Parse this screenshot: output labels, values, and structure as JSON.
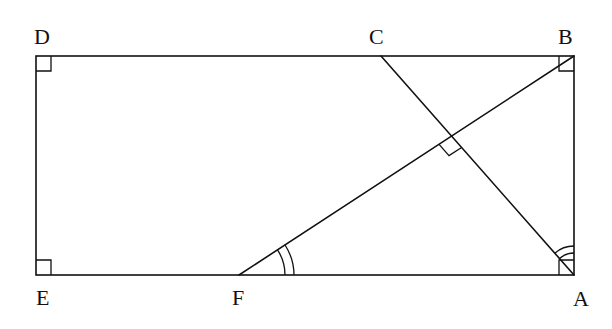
{
  "diagram": {
    "title": "",
    "points": {
      "D": {
        "label": "D",
        "x": 36,
        "y": 56
      },
      "C": {
        "label": "C",
        "x": 381,
        "y": 56
      },
      "B": {
        "label": "B",
        "x": 574,
        "y": 56
      },
      "E": {
        "label": "E",
        "x": 36,
        "y": 275
      },
      "F": {
        "label": "F",
        "x": 239,
        "y": 275
      },
      "A": {
        "label": "A",
        "x": 574,
        "y": 275
      }
    },
    "segments": [
      "DB",
      "BA",
      "AE",
      "ED",
      "CA",
      "FB"
    ],
    "right_angles": [
      "D",
      "B",
      "E",
      "A",
      "intersection of CA and FB"
    ],
    "equal_angles": [
      "angle BFA (double arc)",
      "angle BAC (double arc)"
    ],
    "stroke_color": "#111111",
    "background": "#ffffff"
  }
}
